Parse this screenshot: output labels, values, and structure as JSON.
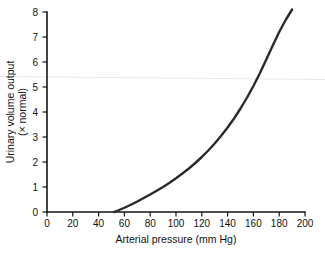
{
  "chart_data": {
    "type": "line",
    "title": "",
    "xlabel": "Arterial pressure (mm Hg)",
    "ylabel_line1": "Urinary volume output",
    "ylabel_line2": "(× normal)",
    "xlim": [
      0,
      200
    ],
    "ylim": [
      0,
      8
    ],
    "xticks": [
      0,
      20,
      40,
      60,
      80,
      100,
      120,
      140,
      160,
      180,
      200
    ],
    "yticks": [
      0,
      1,
      2,
      3,
      4,
      5,
      6,
      7,
      8
    ],
    "xtick_labels": [
      "0",
      "20",
      "40",
      "60",
      "80",
      "100",
      "120",
      "140",
      "160",
      "180",
      "200"
    ],
    "ytick_labels": [
      "0",
      "1",
      "2",
      "3",
      "4",
      "5",
      "6",
      "7",
      "8"
    ],
    "grid": false,
    "legend": "none",
    "series": [
      {
        "name": "Renal output curve",
        "color": "#2a2a2a",
        "x": [
          52,
          55,
          60,
          65,
          70,
          75,
          80,
          85,
          90,
          95,
          100,
          105,
          110,
          115,
          120,
          125,
          130,
          135,
          140,
          145,
          150,
          155,
          160,
          165,
          170,
          175,
          180,
          185,
          190
        ],
        "y": [
          0.0,
          0.06,
          0.17,
          0.29,
          0.42,
          0.56,
          0.7,
          0.85,
          1.0,
          1.17,
          1.35,
          1.54,
          1.74,
          1.96,
          2.2,
          2.46,
          2.74,
          3.05,
          3.38,
          3.74,
          4.14,
          4.57,
          5.04,
          5.55,
          6.1,
          6.66,
          7.2,
          7.68,
          8.1
        ]
      }
    ],
    "annotations": [
      {
        "name": "scan-artifact-line",
        "type": "horizontal-line",
        "value": 5.45,
        "color": "#e9e9e9"
      }
    ]
  },
  "geometry": {
    "origin_x": 47,
    "origin_y": 212,
    "x_right": 305,
    "y_top": 12
  }
}
